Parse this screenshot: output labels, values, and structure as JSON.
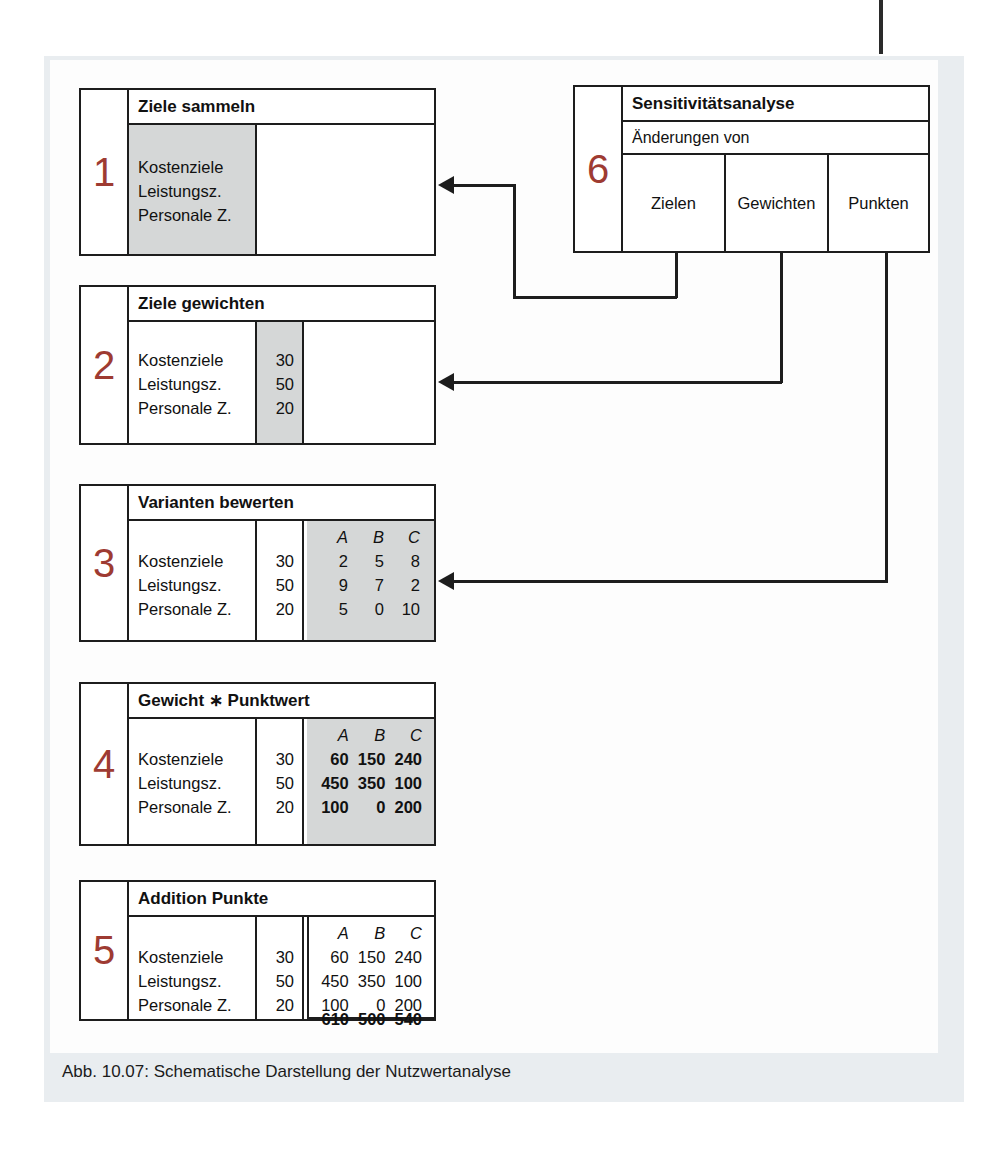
{
  "figure": {
    "caption": "Abb. 10.07: Schematische Darstellung der Nutzwertanalyse",
    "accent_number_color": "#9e3b32",
    "line_color": "#1d1d1d",
    "shade_color": "#d5d7d7",
    "panel_color": "#e9edf0"
  },
  "criteria": [
    "Kostenziele",
    "Leistungsz.",
    "Personale Z."
  ],
  "weights": [
    "30",
    "50",
    "20"
  ],
  "variant_headers": [
    "A",
    "B",
    "C"
  ],
  "steps": [
    {
      "number": "1",
      "title": "Ziele sammeln",
      "labels": [
        "Kostenziele",
        "Leistungsz.",
        "Personale Z."
      ]
    },
    {
      "number": "2",
      "title": "Ziele gewichten",
      "labels": [
        "Kostenziele",
        "Leistungsz.",
        "Personale Z."
      ],
      "weights": [
        "30",
        "50",
        "20"
      ]
    },
    {
      "number": "3",
      "title": "Varianten bewerten",
      "labels": [
        "Kostenziele",
        "Leistungsz.",
        "Personale Z."
      ],
      "weights": [
        "30",
        "50",
        "20"
      ],
      "headers": [
        "A",
        "B",
        "C"
      ],
      "scores": [
        [
          "2",
          "5",
          "8"
        ],
        [
          "9",
          "7",
          "2"
        ],
        [
          "5",
          "0",
          "10"
        ]
      ]
    },
    {
      "number": "4",
      "title": "Gewicht ∗ Punktwert",
      "labels": [
        "Kostenziele",
        "Leistungsz.",
        "Personale Z."
      ],
      "weights": [
        "30",
        "50",
        "20"
      ],
      "headers": [
        "A",
        "B",
        "C"
      ],
      "products": [
        [
          "60",
          "150",
          "240"
        ],
        [
          "450",
          "350",
          "100"
        ],
        [
          "100",
          "0",
          "200"
        ]
      ]
    },
    {
      "number": "5",
      "title": "Addition Punkte",
      "labels": [
        "Kostenziele",
        "Leistungsz.",
        "Personale Z."
      ],
      "weights": [
        "30",
        "50",
        "20"
      ],
      "headers": [
        "A",
        "B",
        "C"
      ],
      "products": [
        [
          "60",
          "150",
          "240"
        ],
        [
          "450",
          "350",
          "100"
        ],
        [
          "100",
          "0",
          "200"
        ]
      ],
      "totals": [
        "610",
        "500",
        "540"
      ]
    },
    {
      "number": "6",
      "title": "Sensitivitätsanalyse",
      "subtitle": "Änderungen von",
      "columns": [
        "Zielen",
        "Gewichten",
        "Punkten"
      ]
    }
  ]
}
